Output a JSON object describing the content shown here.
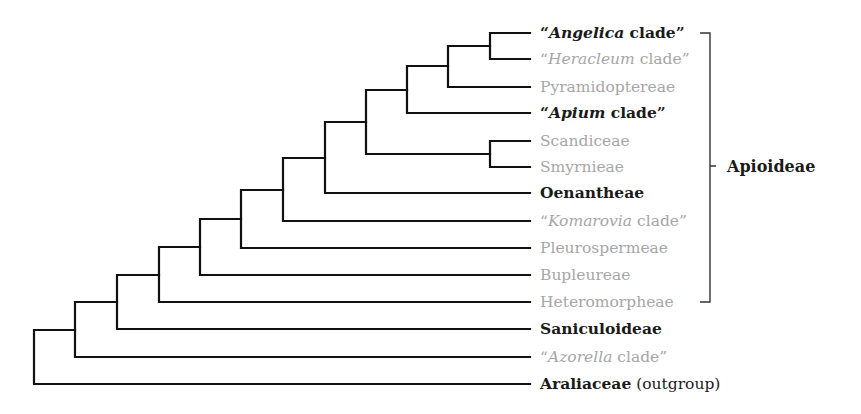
{
  "diagram": {
    "type": "phylogenetic-tree (cladogram)",
    "line_color": "#111111",
    "label_colors": {
      "bold": "#1a1a1a",
      "grey": "#a6a6a6"
    },
    "leaves": [
      {
        "id": "angelica",
        "y": 33,
        "style": "bold",
        "quote": true,
        "italic": "Angelica",
        "rest": " clade",
        "text": "“Angelica clade”"
      },
      {
        "id": "heracleum",
        "y": 59,
        "style": "grey",
        "quote": true,
        "italic": "Heracleum",
        "rest": " clade",
        "text": "“Heracleum clade”"
      },
      {
        "id": "pyramidoptereae",
        "y": 87,
        "style": "grey",
        "quote": false,
        "italic": "",
        "rest": "Pyramidoptereae",
        "text": "Pyramidoptereae"
      },
      {
        "id": "apium",
        "y": 113,
        "style": "bold",
        "quote": true,
        "italic": "Apium",
        "rest": " clade",
        "text": "“Apium clade”"
      },
      {
        "id": "scandiceae",
        "y": 141,
        "style": "grey",
        "quote": false,
        "italic": "",
        "rest": "Scandiceae",
        "text": "Scandiceae"
      },
      {
        "id": "smyrnieae",
        "y": 167,
        "style": "grey",
        "quote": false,
        "italic": "",
        "rest": "Smyrnieae",
        "text": "Smyrnieae"
      },
      {
        "id": "oenantheae",
        "y": 193,
        "style": "bold",
        "quote": false,
        "italic": "",
        "rest": "Oenantheae",
        "text": "Oenantheae"
      },
      {
        "id": "komarovia",
        "y": 221,
        "style": "grey",
        "quote": true,
        "italic": "Komarovia",
        "rest": " clade",
        "text": "“Komarovia clade”"
      },
      {
        "id": "pleurospermeae",
        "y": 248,
        "style": "grey",
        "quote": false,
        "italic": "",
        "rest": "Pleurospermeae",
        "text": "Pleurospermeae"
      },
      {
        "id": "bupleureae",
        "y": 275,
        "style": "grey",
        "quote": false,
        "italic": "",
        "rest": "Bupleureae",
        "text": "Bupleureae"
      },
      {
        "id": "heteromorpheae",
        "y": 302,
        "style": "grey",
        "quote": false,
        "italic": "",
        "rest": "Heteromorpheae",
        "text": "Heteromorpheae"
      },
      {
        "id": "saniculoideae",
        "y": 329,
        "style": "bold",
        "quote": false,
        "italic": "",
        "rest": "Saniculoideae",
        "text": "Saniculoideae"
      },
      {
        "id": "azorella",
        "y": 357,
        "style": "grey",
        "quote": true,
        "italic": "Azorella",
        "rest": " clade",
        "text": "“Azorella clade”"
      },
      {
        "id": "araliaceae",
        "y": 384,
        "style": "bold",
        "quote": false,
        "italic": "",
        "rest": "Araliaceae",
        "suffix": " (outgroup)",
        "text": "Araliaceae (outgroup)"
      }
    ],
    "clade_bracket": {
      "label": "Apioideae",
      "from_leaf": "angelica",
      "to_leaf": "heteromorpheae"
    },
    "newick": "((((((((((((Angelica,Heracleum),Pyramidoptereae),Apium),(Scandiceae,Smyrnieae)),Oenantheae),Komarovia),Pleurospermeae),Bupleureae),Heteromorpheae),Saniculoideae),Azorella),Araliaceae);"
  }
}
